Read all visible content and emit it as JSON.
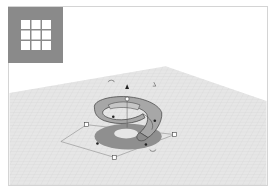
{
  "app": {
    "name": "3D design workplane",
    "view": "perspective"
  },
  "toolbar": {
    "grid_button": {
      "icon": "grid-3x3-icon",
      "label": ""
    }
  },
  "workplane": {
    "colors": {
      "background": "#ffffff",
      "plane": "#e4e4e4",
      "grid_line": "#d2d2d2",
      "shadow": "#8f8f8f",
      "shape_fill": "#a9a9a9",
      "shape_edge": "#3c3c3c",
      "frame_border": "#d4d4d4",
      "grid_tile": "#8a8a8a"
    },
    "handles": {
      "corner": [
        "top-left",
        "right",
        "bottom",
        "hidden-back"
      ],
      "midpoints": 4,
      "rotate_arrows": 3,
      "height_handle": "cone-up"
    }
  },
  "shape": {
    "type": "spiral-ring",
    "selected": true
  }
}
